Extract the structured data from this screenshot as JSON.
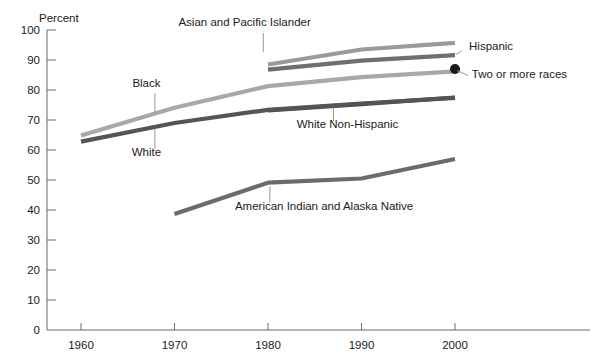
{
  "chart_data": {
    "type": "line",
    "title": "",
    "subtitle": "",
    "xlabel": "",
    "ylabel": "Percent",
    "ylim": [
      0,
      100
    ],
    "xlim": [
      1960,
      2000
    ],
    "y_ticks": [
      0,
      10,
      20,
      30,
      40,
      50,
      60,
      70,
      80,
      90,
      100
    ],
    "x_ticks": [
      1960,
      1970,
      1980,
      1990,
      2000
    ],
    "grid": false,
    "legend": "inline-annotations",
    "series": [
      {
        "name": "Asian and Pacific Islander",
        "color": "#9a9a9a",
        "x": [
          1980,
          1990,
          2000
        ],
        "values": [
          88.5,
          93.5,
          95.7
        ],
        "label_x": 1977.5,
        "label_y": 101.5,
        "label_anchor": "middle",
        "leader_from_x": 1979.5,
        "leader_from_y": 99.0,
        "leader_to_x": 1979.5,
        "leader_to_y": 92.6
      },
      {
        "name": "Hispanic",
        "color": "#6f6f6f",
        "x": [
          1980,
          1990,
          2000
        ],
        "values": [
          86.8,
          89.8,
          91.6
        ],
        "label_x": 2001.5,
        "label_y": 93.5,
        "label_anchor": "start",
        "leader_from_x": 2000.7,
        "leader_from_y": 93.0,
        "leader_to_x": 2000.1,
        "leader_to_y": 91.9
      },
      {
        "name": "Black",
        "color": "#a8a8a8",
        "x": [
          1960,
          1970,
          1980,
          1990,
          2000
        ],
        "values": [
          64.8,
          74.1,
          81.3,
          84.3,
          86.2
        ],
        "label_x": 1967.0,
        "label_y": 81.0,
        "label_anchor": "middle",
        "leader_from_x": 1967.9,
        "leader_from_y": 79.0,
        "leader_to_x": 1967.9,
        "leader_to_y": 72.5
      },
      {
        "name": "Two or more races",
        "color": "#1a1a1a",
        "x": [
          2000
        ],
        "values": [
          87.0
        ],
        "marker": "dot",
        "label_x": 2001.8,
        "label_y": 84.0,
        "label_anchor": "start",
        "leader_from_x": 2001.4,
        "leader_from_y": 84.8,
        "leader_to_x": 2000.2,
        "leader_to_y": 86.5
      },
      {
        "name": "White Non-Hispanic",
        "color": "#4a4a4a",
        "x": [
          1980,
          1990,
          2000
        ],
        "values": [
          73.2,
          75.3,
          77.5
        ],
        "label_x": 1988.5,
        "label_y": 67.5,
        "label_anchor": "middle",
        "leader_from_x": 1987.0,
        "leader_from_y": 69.5,
        "leader_to_x": 1987.0,
        "leader_to_y": 74.3
      },
      {
        "name": "White",
        "color": "#555555",
        "x": [
          1960,
          1970,
          1980,
          1990,
          2000
        ],
        "values": [
          62.8,
          69.0,
          73.4,
          75.5,
          77.4
        ],
        "label_x": 1967.0,
        "label_y": 58.0,
        "label_anchor": "middle",
        "leader_from_x": 1967.9,
        "leader_from_y": 60.5,
        "leader_to_x": 1967.9,
        "leader_to_y": 67.0
      },
      {
        "name": "American Indian and Alaska Native",
        "color": "#6b6b6b",
        "x": [
          1970,
          1980,
          1990,
          2000
        ],
        "values": [
          38.7,
          49.1,
          50.5,
          57.0
        ],
        "label_x": 1986.0,
        "label_y": 40.0,
        "label_anchor": "middle",
        "leader_from_x": 1980.2,
        "leader_from_y": 42.5,
        "leader_to_x": 1980.2,
        "leader_to_y": 47.8
      }
    ]
  }
}
